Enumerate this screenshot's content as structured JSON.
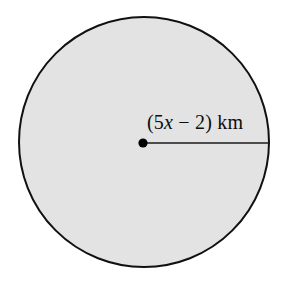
{
  "figure": {
    "type": "circle-with-radius",
    "background_color": "#ffffff",
    "circle": {
      "fill_color": "#e3e3e3",
      "stroke_color": "#111111",
      "stroke_width": 2,
      "center_x": 144,
      "center_y": 142,
      "radius": 126
    },
    "center_point": {
      "color": "#000000",
      "radius": 4.5,
      "x": 143,
      "y": 143
    },
    "radius_segment": {
      "color": "#1a1a1a",
      "stroke_width": 1.6,
      "x1": 143,
      "y1": 143,
      "x2": 270,
      "y2": 143
    },
    "label": {
      "prefix": "(5",
      "variable": "x",
      "middle": " − 2) ",
      "unit": "km",
      "full_text": "(5x − 2) km",
      "color": "#0d0d0d"
    }
  }
}
